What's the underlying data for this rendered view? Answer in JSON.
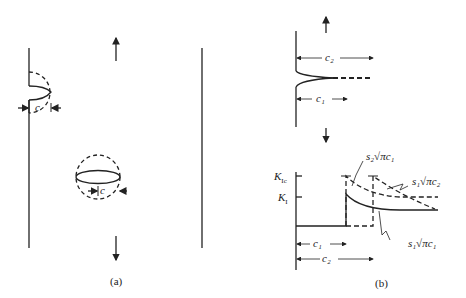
{
  "panels": {
    "a": {
      "caption": "(a)",
      "edge_crack_label": "c",
      "center_crack_label": "c"
    },
    "b": {
      "caption": "(b)",
      "top": {
        "c1_label": "c₁",
        "c2_label": "c₂"
      },
      "graph": {
        "y_ticks": [
          "K_Ic",
          "K_I"
        ],
        "kic_label": "K",
        "kic_sub": "Ic",
        "ki_label": "K",
        "ki_sub": "I",
        "x_dims": [
          "c₁",
          "c₂"
        ],
        "c1_label": "c₁",
        "c2_label": "c₂",
        "annotations": {
          "s2_sqrt_pi_c1": "s₂√πc₁",
          "s1_sqrt_pi_c2": "s₁√πc₂",
          "s1_sqrt_pi_c1": "s₁√πc₁"
        }
      }
    }
  },
  "colors": {
    "ink": "#222222",
    "background": "#ffffff"
  }
}
